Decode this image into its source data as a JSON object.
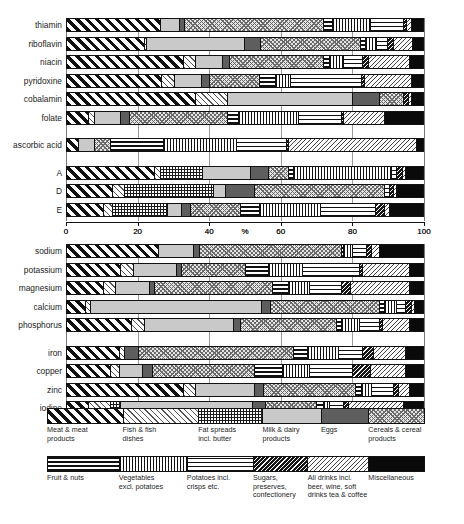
{
  "chart_data": {
    "type": "bar",
    "subtype": "stacked-horizontal-100percent",
    "title": "",
    "xlabel": "%",
    "ylabel": "",
    "xlim": [
      0,
      100
    ],
    "xticks": [
      0,
      20,
      40,
      60,
      80,
      100
    ],
    "xticklabels": [
      "0",
      "20",
      "40",
      "60",
      "80",
      "100"
    ],
    "axis_center_label": "%",
    "grid": true,
    "grid_axis": "x",
    "legend_position": "bottom",
    "panels": [
      {
        "name": "vitamins",
        "groups": [
          {
            "categories": [
              "thiamin",
              "riboflavin",
              "niacin",
              "pyridoxine",
              "cobalamin",
              "folate"
            ]
          },
          {
            "categories": [
              "ascorbic acid"
            ]
          },
          {
            "categories": [
              "A",
              "D",
              "E"
            ]
          }
        ]
      },
      {
        "name": "minerals",
        "groups": [
          {
            "categories": [
              "sodium",
              "potassium",
              "magnesium",
              "calcium",
              "phosphorus"
            ]
          },
          {
            "categories": [
              "iron",
              "copper",
              "zinc",
              "iodine"
            ]
          }
        ]
      }
    ],
    "series": [
      {
        "name": "Meat & meat products",
        "key": "meat"
      },
      {
        "name": "Fish & fish dishes",
        "key": "fish"
      },
      {
        "name": "Fat spreads incl. butter",
        "key": "fat"
      },
      {
        "name": "Milk & dairy products",
        "key": "milk"
      },
      {
        "name": "Eggs",
        "key": "eggs"
      },
      {
        "name": "Cereals & cereal products",
        "key": "cereal"
      },
      {
        "name": "Fruit & nuts",
        "key": "fruit"
      },
      {
        "name": "Vegetables excl. potatoes",
        "key": "veg"
      },
      {
        "name": "Potatoes incl. crisps etc.",
        "key": "potato"
      },
      {
        "name": "Sugars, preserves, confectionery",
        "key": "sugar"
      },
      {
        "name": "All drinks incl. beer, wine, soft drinks tea & coffee",
        "key": "drink"
      },
      {
        "name": "Miscellaneous",
        "key": "misc"
      }
    ],
    "rows": [
      {
        "label": "thiamin",
        "values": {
          "meat": 26.0,
          "fish": 0.0,
          "fat": 0.0,
          "milk": 5.5,
          "eggs": 1.5,
          "cereal": 39.0,
          "fruit": 2.5,
          "veg": 10.5,
          "potato": 9.5,
          "sugar": 0.8,
          "drink": 1.2,
          "misc": 3.5
        }
      },
      {
        "label": "riboflavin",
        "values": {
          "meat": 21.5,
          "fish": 0.8,
          "fat": 0.0,
          "milk": 27.5,
          "eggs": 4.5,
          "cereal": 28.0,
          "fruit": 1.5,
          "veg": 3.0,
          "potato": 3.0,
          "sugar": 1.8,
          "drink": 5.4,
          "misc": 3.0
        }
      },
      {
        "label": "niacin",
        "values": {
          "meat": 32.5,
          "fish": 3.5,
          "fat": 0.0,
          "milk": 7.5,
          "eggs": 2.0,
          "cereal": 26.5,
          "fruit": 1.5,
          "veg": 4.0,
          "potato": 5.5,
          "sugar": 1.5,
          "drink": 11.5,
          "misc": 4.0
        }
      },
      {
        "label": "pyridoxine",
        "values": {
          "meat": 26.5,
          "fish": 3.5,
          "fat": 0.0,
          "milk": 7.5,
          "eggs": 2.5,
          "cereal": 14.0,
          "fruit": 4.5,
          "veg": 4.0,
          "potato": 20.0,
          "sugar": 0.8,
          "drink": 13.2,
          "misc": 3.5
        }
      },
      {
        "label": "cobalamin",
        "values": {
          "meat": 36.0,
          "fish": 9.0,
          "fat": 0.0,
          "milk": 35.0,
          "eggs": 7.5,
          "cereal": 7.0,
          "fruit": 0.0,
          "veg": 0.0,
          "potato": 0.0,
          "sugar": 1.2,
          "drink": 0.8,
          "misc": 3.5
        }
      },
      {
        "label": "folate",
        "values": {
          "meat": 6.0,
          "fish": 1.5,
          "fat": 0.0,
          "milk": 7.5,
          "eggs": 2.5,
          "cereal": 27.5,
          "fruit": 3.0,
          "veg": 17.0,
          "potato": 12.0,
          "sugar": 0.5,
          "drink": 11.5,
          "misc": 11.0
        }
      },
      {
        "label": "ascorbic acid",
        "values": {
          "meat": 3.0,
          "fish": 0.0,
          "fat": 0.0,
          "milk": 4.5,
          "eggs": 0.0,
          "cereal": 4.5,
          "fruit": 15.0,
          "veg": 20.5,
          "potato": 14.0,
          "sugar": 0.5,
          "drink": 36.0,
          "misc": 2.0
        }
      },
      {
        "label": "A",
        "values": {
          "meat": 24.5,
          "fish": 1.5,
          "fat": 12.0,
          "milk": 13.5,
          "eggs": 5.0,
          "cereal": 5.5,
          "fruit": 1.5,
          "veg": 27.5,
          "potato": 1.5,
          "sugar": 1.5,
          "drink": 1.0,
          "misc": 5.0
        }
      },
      {
        "label": "D",
        "values": {
          "meat": 12.5,
          "fish": 3.5,
          "fat": 25.0,
          "milk": 3.5,
          "eggs": 8.0,
          "cereal": 36.5,
          "fruit": 0.0,
          "veg": 0.0,
          "potato": 1.5,
          "sugar": 1.0,
          "drink": 1.0,
          "misc": 7.5
        }
      },
      {
        "label": "E",
        "values": {
          "meat": 10.0,
          "fish": 2.5,
          "fat": 15.5,
          "milk": 4.0,
          "eggs": 2.5,
          "cereal": 14.0,
          "fruit": 5.5,
          "veg": 17.0,
          "potato": 15.5,
          "sugar": 2.5,
          "drink": 1.5,
          "misc": 9.5
        }
      },
      {
        "label": "sodium",
        "values": {
          "meat": 25.5,
          "fish": 0.0,
          "fat": 0.0,
          "milk": 10.0,
          "eggs": 1.5,
          "cereal": 40.0,
          "fruit": 0.5,
          "veg": 2.5,
          "potato": 4.0,
          "sugar": 1.5,
          "drink": 2.0,
          "misc": 12.5
        }
      },
      {
        "label": "potassium",
        "values": {
          "meat": 15.0,
          "fish": 3.5,
          "fat": 0.0,
          "milk": 12.0,
          "eggs": 1.5,
          "cereal": 18.0,
          "fruit": 6.5,
          "veg": 9.5,
          "potato": 16.0,
          "sugar": 1.0,
          "drink": 13.0,
          "misc": 4.0
        }
      },
      {
        "label": "magnesium",
        "values": {
          "meat": 10.0,
          "fish": 3.5,
          "fat": 0.0,
          "milk": 9.5,
          "eggs": 1.5,
          "cereal": 33.0,
          "fruit": 4.5,
          "veg": 6.0,
          "potato": 9.0,
          "sugar": 2.5,
          "drink": 16.5,
          "misc": 4.0
        }
      },
      {
        "label": "calcium",
        "values": {
          "meat": 5.0,
          "fish": 1.5,
          "fat": 0.0,
          "milk": 48.0,
          "eggs": 2.5,
          "cereal": 30.5,
          "fruit": 1.5,
          "veg": 3.5,
          "potato": 2.5,
          "sugar": 1.5,
          "drink": 1.0,
          "misc": 2.5
        }
      },
      {
        "label": "phosphorus",
        "values": {
          "meat": 18.0,
          "fish": 3.5,
          "fat": 0.0,
          "milk": 25.0,
          "eggs": 2.0,
          "cereal": 27.0,
          "fruit": 1.5,
          "veg": 5.0,
          "potato": 5.5,
          "sugar": 1.0,
          "drink": 7.5,
          "misc": 4.0
        }
      },
      {
        "label": "iron",
        "values": {
          "meat": 14.5,
          "fish": 1.5,
          "fat": 0.0,
          "milk": 0.0,
          "eggs": 4.0,
          "cereal": 43.5,
          "fruit": 4.0,
          "veg": 8.5,
          "potato": 7.0,
          "sugar": 3.0,
          "drink": 9.0,
          "misc": 5.0
        }
      },
      {
        "label": "copper",
        "values": {
          "meat": 12.0,
          "fish": 2.5,
          "fat": 0.0,
          "milk": 6.5,
          "eggs": 3.0,
          "cereal": 28.5,
          "fruit": 8.0,
          "veg": 7.5,
          "potato": 12.0,
          "sugar": 5.0,
          "drink": 10.0,
          "misc": 5.0
        }
      },
      {
        "label": "zinc",
        "values": {
          "meat": 32.5,
          "fish": 3.5,
          "fat": 0.0,
          "milk": 16.5,
          "eggs": 2.5,
          "cereal": 26.0,
          "fruit": 1.5,
          "veg": 3.0,
          "potato": 6.0,
          "sugar": 1.5,
          "drink": 3.0,
          "misc": 4.0
        }
      },
      {
        "label": "iodine",
        "values": {
          "meat": 6.0,
          "fish": 3.5,
          "fat": 0.0,
          "milk": 0.0,
          "eggs": 2.5,
          "cereal": 0.0,
          "fruit": 0.0,
          "veg": 0.0,
          "potato": 0.0,
          "sugar": 0.0,
          "drink": 0.0,
          "misc": 0.0
        },
        "segments": [
          {
            "key": "meat",
            "value": 6.0
          },
          {
            "key": "fish",
            "value": 6.0
          },
          {
            "key": "fat",
            "value": 3.0
          },
          {
            "key": "milk",
            "value": 37.0
          },
          {
            "key": "eggs",
            "value": 3.5
          },
          {
            "key": "cereal",
            "value": 14.5
          },
          {
            "key": "fruit",
            "value": 2.0
          },
          {
            "key": "veg",
            "value": 1.5
          },
          {
            "key": "potato",
            "value": 4.0
          },
          {
            "key": "sugar",
            "value": 1.5
          },
          {
            "key": "drink",
            "value": 15.5
          },
          {
            "key": "misc",
            "value": 5.5
          }
        ]
      }
    ]
  },
  "legend": {
    "row1": [
      {
        "key": "meat",
        "label_line1": "Meat & meat",
        "label_line2": "products",
        "width": 20.0
      },
      {
        "key": "fish",
        "label_line1": "Fish & fish",
        "label_line2": "dishes",
        "width": 20.0
      },
      {
        "key": "fat",
        "label_line1": "Fat spreads",
        "label_line2": "incl. butter",
        "width": 17.0
      },
      {
        "key": "milk",
        "label_line1": "Milk & dairy",
        "label_line2": "products",
        "width": 15.5
      },
      {
        "key": "eggs",
        "label_line1": "Eggs",
        "label_line2": "",
        "width": 12.5
      },
      {
        "key": "cereal",
        "label_line1": "Cereals & cereal",
        "label_line2": "products",
        "width": 15.0
      }
    ],
    "row2": [
      {
        "key": "potato_spacer",
        "label_line1": "",
        "label_line2": "",
        "label_line3": "",
        "width": 0
      },
      {
        "key": "fruit",
        "label_line1": "Fruit & nuts",
        "label_line2": "",
        "label_line3": "",
        "width": 19.0
      },
      {
        "key": "veg",
        "label_line1": "Vegetables",
        "label_line2": "excl. potatoes",
        "label_line3": "",
        "width": 18.0
      },
      {
        "key": "potato",
        "label_line1": "Potatoes incl.",
        "label_line2": "crisps etc.",
        "label_line3": "",
        "width": 17.5
      },
      {
        "key": "sugar",
        "label_line1": "Sugars,",
        "label_line2": "preserves,",
        "label_line3": "confectionery",
        "width": 14.5
      },
      {
        "key": "drink",
        "label_line1": "All drinks incl.",
        "label_line2": "beer, wine, soft",
        "label_line3": "drinks tea & coffee",
        "width": 16.0
      },
      {
        "key": "misc",
        "label_line1": "Miscellaneous",
        "label_line2": "",
        "label_line3": "",
        "width": 15.0
      }
    ]
  },
  "caption": {
    "text": ""
  }
}
